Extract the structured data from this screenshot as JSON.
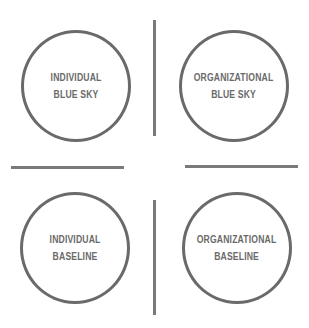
{
  "diagram": {
    "type": "quadrant",
    "quadrants": [
      {
        "position": "top-left",
        "line1": "INDIVIDUAL",
        "line2": "BLUE SKY"
      },
      {
        "position": "top-right",
        "line1": "ORGANIZATIONAL",
        "line2": "BLUE SKY"
      },
      {
        "position": "bottom-left",
        "line1": "INDIVIDUAL",
        "line2": "BASELINE"
      },
      {
        "position": "bottom-right",
        "line1": "ORGANIZATIONAL",
        "line2": "BASELINE"
      }
    ],
    "colors": {
      "stroke": "#6a6a6a",
      "divider": "#7a7a7a",
      "background": "#ffffff"
    }
  }
}
